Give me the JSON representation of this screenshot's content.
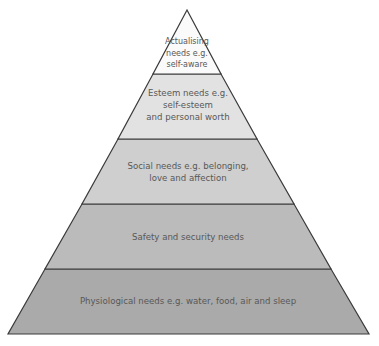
{
  "diagram": {
    "type": "pyramid",
    "title": "",
    "colors": {
      "outline": "#3a3a3a",
      "text": "#585858",
      "background": "#ffffff"
    },
    "tiers": [
      {
        "level": 5,
        "label": "Actualising\nneeds e.g.\nself-aware",
        "fill": "#fafafa"
      },
      {
        "level": 4,
        "label": "Esteem needs e.g.\nself-esteem\nand personal worth",
        "fill": "#e2e2e2"
      },
      {
        "level": 3,
        "label": "Social needs e.g. belonging,\nlove and affection",
        "fill": "#cfcfcf"
      },
      {
        "level": 2,
        "label": "Safety and security needs",
        "fill": "#bbbbbb"
      },
      {
        "level": 1,
        "label": "Physiological needs e.g. water, food, air and sleep",
        "fill": "#aaaaaa"
      }
    ]
  }
}
